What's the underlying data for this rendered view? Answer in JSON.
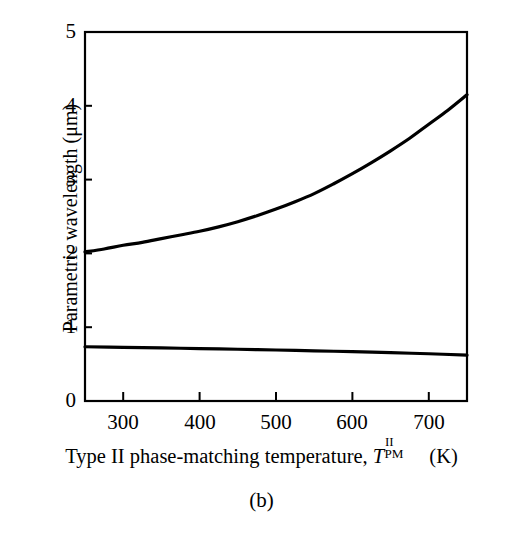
{
  "figure": {
    "caption": "(b)",
    "background_color": "#ffffff",
    "line_color": "#000000",
    "axis_color": "#000000"
  },
  "axes": {
    "ylabel": "Parametric wavelength (μm)",
    "xlabel_parts": {
      "prefix": "Type II phase-matching temperature, ",
      "symbol": "T",
      "superscript": "II",
      "subscript": "PM",
      "suffix": " (K)"
    },
    "xlabel_plain": "Type II phase-matching temperature, T_PM^II (K)",
    "ytick_labels": [
      "0",
      "1",
      "2",
      "3",
      "4",
      "5"
    ],
    "xtick_labels": [
      "300",
      "400",
      "500",
      "600",
      "700"
    ]
  },
  "chart_data": {
    "type": "line",
    "title": "",
    "subtitle": "(b)",
    "xlabel": "Type II phase-matching temperature, T_PM^II (K)",
    "ylabel": "Parametric wavelength (μm)",
    "xlim": [
      250,
      750
    ],
    "ylim": [
      0,
      5
    ],
    "xticks": [
      300,
      400,
      500,
      600,
      700
    ],
    "yticks": [
      0,
      1,
      2,
      3,
      4,
      5
    ],
    "grid": false,
    "legend": null,
    "series": [
      {
        "name": "idler",
        "x": [
          250,
          275,
          300,
          325,
          350,
          375,
          400,
          425,
          450,
          475,
          500,
          525,
          550,
          575,
          600,
          625,
          650,
          675,
          700,
          725,
          750
        ],
        "values": [
          2.02,
          2.06,
          2.11,
          2.15,
          2.2,
          2.25,
          2.3,
          2.36,
          2.43,
          2.51,
          2.6,
          2.7,
          2.81,
          2.94,
          3.08,
          3.23,
          3.39,
          3.56,
          3.75,
          3.94,
          4.15
        ]
      },
      {
        "name": "signal",
        "x": [
          250,
          300,
          350,
          400,
          450,
          500,
          550,
          600,
          650,
          700,
          750
        ],
        "values": [
          0.735,
          0.727,
          0.719,
          0.71,
          0.701,
          0.691,
          0.68,
          0.668,
          0.655,
          0.64,
          0.622
        ]
      }
    ]
  }
}
